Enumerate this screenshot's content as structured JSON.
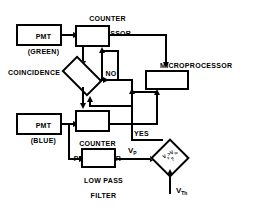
{
  "diagram": {
    "background": "#ffffff",
    "line_color": "#000000"
  },
  "blocks": {
    "pmt_green": {
      "line1": "PMT",
      "line2": "(GREEN)"
    },
    "pmt_blue": {
      "line1": "PMT",
      "line2": "(BLUE)"
    },
    "counter_processor_top": {
      "line1": "COUNTER",
      "line2": "PROCESSOR"
    },
    "counter_processor_bottom": {
      "line1": "COUNTER",
      "line2": "PROCESSOR"
    },
    "low_pass_filter": {
      "line1": "LOW PASS",
      "line2": "FILTER"
    },
    "microprocessor": {
      "label": "MICROPROCESSOR"
    }
  },
  "decisions": {
    "coincidence": {
      "label": "COINCIDENCE"
    },
    "threshold": {
      "expr_v": "V",
      "expr_p": "p",
      "expr_gt": ">",
      "expr_v2": "V",
      "expr_th": "Th",
      "expr_q": "?",
      "full": "Vp > VTh ?"
    }
  },
  "edge_labels": {
    "no": "NO",
    "yes": "YES",
    "vp": "V",
    "vp_sub": "P",
    "vth": "V",
    "vth_sub": "Th"
  }
}
